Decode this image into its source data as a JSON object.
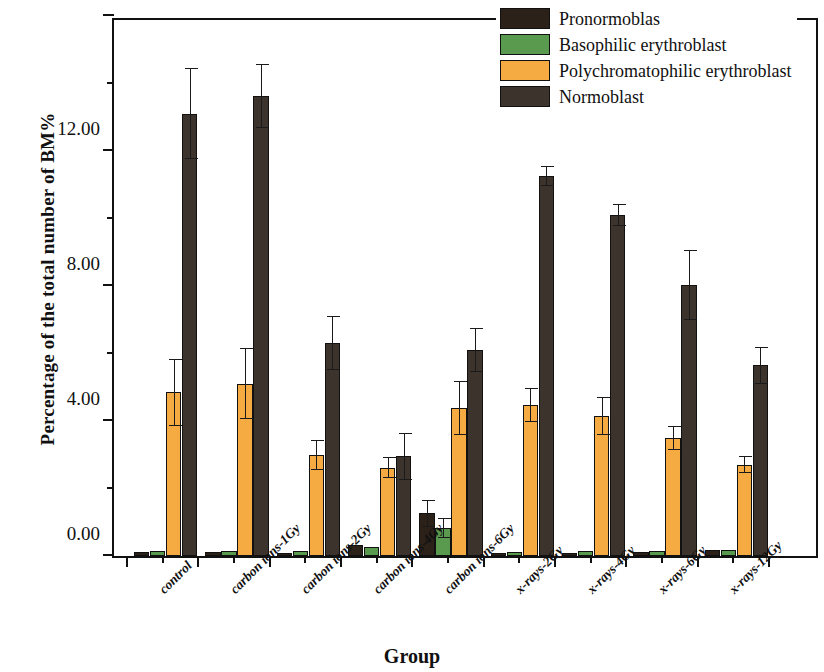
{
  "chart_data": {
    "type": "bar",
    "title": "",
    "xlabel": "Group",
    "ylabel": "Percentage of the total number of BM%",
    "ylim": [
      0,
      16
    ],
    "ytick_labels": [
      "0.00",
      "4.00",
      "8.00",
      "12.00",
      "16.00"
    ],
    "ytick_values": [
      0,
      4,
      8,
      12,
      16
    ],
    "yminor_values": [
      2,
      6,
      10,
      14
    ],
    "grid": false,
    "legend_position": "top-right",
    "categories": [
      "control",
      "carbon ions-1Gy",
      "carbon ions-2Gy",
      "carbon ions-4Gy",
      "carbon ions-6Gy",
      "x-rays-2Gy",
      "x-rays-4Gy",
      "x-rays-6Gy",
      "x-rays-12Gy"
    ],
    "series": [
      {
        "name": "Pronormoblas",
        "color": "#2b2119",
        "values": [
          0.12,
          0.12,
          0.1,
          0.34,
          1.27,
          0.1,
          0.1,
          0.12,
          0.17
        ],
        "errors": [
          0.0,
          0.0,
          0.0,
          0.0,
          0.4,
          0.0,
          0.0,
          0.0,
          0.0
        ]
      },
      {
        "name": "Basophilic erythroblast",
        "color": "#5a9a4e",
        "values": [
          0.15,
          0.15,
          0.16,
          0.28,
          0.83,
          0.13,
          0.14,
          0.15,
          0.18
        ],
        "errors": [
          0.0,
          0.0,
          0.0,
          0.0,
          0.3,
          0.0,
          0.0,
          0.0,
          0.0
        ]
      },
      {
        "name": "Polychromatophilic erythroblast",
        "color": "#f6ab42",
        "values": [
          4.85,
          5.1,
          3.0,
          2.62,
          4.38,
          4.48,
          4.15,
          3.5,
          2.7
        ],
        "errors": [
          1.0,
          1.05,
          0.45,
          0.3,
          0.8,
          0.5,
          0.55,
          0.35,
          0.25
        ]
      },
      {
        "name": "Normoblast",
        "color": "#3b332c",
        "values": [
          13.1,
          13.62,
          6.3,
          2.95,
          6.1,
          11.26,
          10.1,
          8.03,
          5.65
        ],
        "errors": [
          1.35,
          0.95,
          0.8,
          0.7,
          0.65,
          0.3,
          0.32,
          1.05,
          0.55
        ]
      }
    ]
  },
  "legend": {
    "items": [
      "Pronormoblas",
      "Basophilic erythroblast",
      "Polychromatophilic erythroblast",
      "Normoblast"
    ]
  }
}
